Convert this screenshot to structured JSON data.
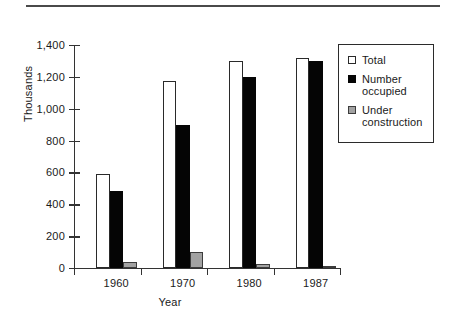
{
  "figure": {
    "top_rule": true,
    "background_color": "#ffffff"
  },
  "chart_data": {
    "type": "bar",
    "title": "",
    "subtitle": "",
    "xlabel": "Year",
    "ylabel": "Thousands",
    "categories": [
      "1960",
      "1970",
      "1980",
      "1987"
    ],
    "series": [
      {
        "name": "Total",
        "color": "#ffffff",
        "border_color": "#2a2a2a",
        "values": [
          590,
          1175,
          1300,
          1320
        ]
      },
      {
        "name": "Number occupied",
        "color": "#050505",
        "border_color": "#050505",
        "values": [
          485,
          900,
          1200,
          1300
        ]
      },
      {
        "name": "Under construction",
        "color": "#a2a2a2",
        "border_color": "#3c3c3c",
        "values": [
          35,
          100,
          25,
          15
        ]
      }
    ],
    "ylim": [
      0,
      1400
    ],
    "yticks": [
      0,
      200,
      400,
      600,
      800,
      1000,
      1200,
      1400
    ],
    "ytick_labels": [
      "0",
      "200",
      "400",
      "600",
      "800",
      "1,000",
      "1,200",
      "1,400"
    ],
    "grid": false,
    "legend_position": "upper right",
    "legend_entries": [
      "Total",
      "Number occupied",
      "Under construction"
    ]
  },
  "legend": {
    "items": [
      {
        "label_line1": "Total",
        "label_line2": ""
      },
      {
        "label_line1": "Number",
        "label_line2": "occupied"
      },
      {
        "label_line1": "Under",
        "label_line2": "construction"
      }
    ]
  }
}
